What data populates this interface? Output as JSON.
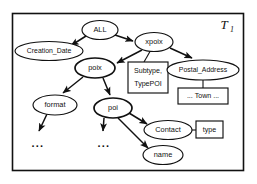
{
  "diagram": {
    "title_label": {
      "base": "T",
      "subscript": "1"
    },
    "nodes": [
      {
        "id": "all",
        "label": "ALL",
        "shape": "ellipse",
        "cx": 100,
        "cy": 30,
        "rx": 18,
        "ry": 9.5
      },
      {
        "id": "creation_date",
        "label": "Creation_Date",
        "shape": "ellipse",
        "cx": 49,
        "cy": 51,
        "rx": 34,
        "ry": 9.5
      },
      {
        "id": "xpoix",
        "label": "xpoix",
        "shape": "ellipse",
        "cx": 154,
        "cy": 42,
        "rx": 19,
        "ry": 9.5
      },
      {
        "id": "poix",
        "label": "poix",
        "shape": "ellipse",
        "cx": 95,
        "cy": 68,
        "rx": 20,
        "ry": 10
      },
      {
        "id": "subtype_box",
        "label": "Subtype,",
        "label2": "TypePOI",
        "shape": "rect",
        "x": 128,
        "y": 62,
        "w": 40,
        "h": 31
      },
      {
        "id": "postal_address",
        "label": "Postal_Address",
        "shape": "ellipse",
        "cx": 203,
        "cy": 70,
        "rx": 36,
        "ry": 10
      },
      {
        "id": "town_box",
        "label": "... Town ...",
        "shape": "rect",
        "x": 178,
        "y": 88,
        "w": 50,
        "h": 16
      },
      {
        "id": "format",
        "label": "format",
        "shape": "ellipse",
        "cx": 55,
        "cy": 105,
        "rx": 22,
        "ry": 10
      },
      {
        "id": "poi",
        "label": "poi",
        "shape": "ellipse",
        "cx": 113,
        "cy": 108,
        "rx": 19,
        "ry": 10
      },
      {
        "id": "contact",
        "label": "Contact",
        "shape": "ellipse",
        "cx": 168,
        "cy": 130,
        "rx": 24,
        "ry": 9.5
      },
      {
        "id": "type_box",
        "label": "type",
        "shape": "rect",
        "x": 196,
        "y": 121,
        "w": 27,
        "h": 17
      },
      {
        "id": "name",
        "label": "name",
        "shape": "ellipse",
        "cx": 163,
        "cy": 155,
        "rx": 20,
        "ry": 9.5
      },
      {
        "id": "ellipsis_format",
        "label": "...",
        "shape": "text",
        "cx": 38,
        "cy": 144
      },
      {
        "id": "ellipsis_poi",
        "label": "...",
        "shape": "text",
        "cx": 104,
        "cy": 144
      }
    ],
    "edges": [
      {
        "id": "all-creation_date",
        "from": "all",
        "to": "creation_date",
        "arrow": true
      },
      {
        "id": "all-xpoix",
        "from": "all",
        "to": "xpoix",
        "arrow": true
      },
      {
        "id": "xpoix-poix",
        "from": "xpoix",
        "to": "poix",
        "arrow": true
      },
      {
        "id": "xpoix-subtype_box",
        "from": "xpoix",
        "to": "subtype_box",
        "arrow": false
      },
      {
        "id": "xpoix-postal_address",
        "from": "xpoix",
        "to": "postal_address",
        "arrow": true
      },
      {
        "id": "postal_address-town_box",
        "from": "postal_address",
        "to": "town_box",
        "arrow": false
      },
      {
        "id": "poix-format",
        "from": "poix",
        "to": "format",
        "arrow": true
      },
      {
        "id": "poix-poi",
        "from": "poix",
        "to": "poi",
        "arrow": true
      },
      {
        "id": "format-ellipsis",
        "from": "format",
        "to": "ellipsis_format",
        "arrow": true
      },
      {
        "id": "poi-ellipsis",
        "from": "poi",
        "to": "ellipsis_poi",
        "arrow": true
      },
      {
        "id": "poi-contact",
        "from": "poi",
        "to": "contact",
        "arrow": true
      },
      {
        "id": "poi-name",
        "from": "poi",
        "to": "name",
        "arrow": true
      },
      {
        "id": "contact-type_box",
        "from": "contact",
        "to": "type_box",
        "arrow": false
      }
    ],
    "colors": {
      "stroke": "#111111",
      "background": "#ffffff"
    }
  }
}
